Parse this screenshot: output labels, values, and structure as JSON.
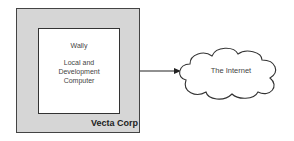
{
  "diagram": {
    "outer_box": {
      "label": "Vecta Corp",
      "fill": "#d6d6d6"
    },
    "inner_box": {
      "name": "Wally",
      "description": "Local and Development Computer",
      "fill": "#ffffff"
    },
    "arrow": {
      "from": "outer_box",
      "to": "cloud"
    },
    "cloud": {
      "label": "The Internet"
    }
  }
}
